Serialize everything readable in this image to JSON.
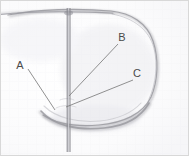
{
  "figure": {
    "media": "scanned pencil sketch",
    "background_color": "#fdfdfd",
    "ink_color": "#9a9aa0",
    "label_color": "#4a4a4a",
    "leader_color": "#7d7d7d",
    "width": 189,
    "height": 156
  },
  "grid": {
    "visible": true,
    "spacing_px": 9,
    "color": "#e9e9ef",
    "opacity": 0.3
  },
  "annotations": [
    {
      "id": "label-a",
      "label": "A",
      "label_x": 22,
      "label_y": 66,
      "leader_from_x": 28,
      "leader_from_y": 69,
      "leader_to_x": 55,
      "leader_to_y": 110
    },
    {
      "id": "label-b",
      "label": "B",
      "label_x": 120,
      "label_y": 41,
      "leader_from_x": 118,
      "leader_from_y": 44,
      "leader_to_x": 69,
      "leader_to_y": 96
    },
    {
      "id": "label-c",
      "label": "C",
      "label_x": 135,
      "label_y": 77,
      "leader_from_x": 133,
      "leader_from_y": 80,
      "leader_to_x": 66,
      "leader_to_y": 107
    }
  ],
  "strokes": {
    "vertical_axis": {
      "name": "vertical-axis-line",
      "x": 68,
      "y_top": 8,
      "y_bottom": 152
    },
    "top_horizontal": {
      "name": "top-horizontal-stroke",
      "x_start": 0,
      "y_start": 14,
      "x_end": 112,
      "y_end": 12
    },
    "outline": {
      "name": "rounded-body-outline",
      "description": "large rounded closed shape spanning right of the vertical axis"
    },
    "bottom_arc": {
      "name": "bottom-arc-stroke",
      "description": "dark arc along the lower boundary of the shape"
    }
  }
}
